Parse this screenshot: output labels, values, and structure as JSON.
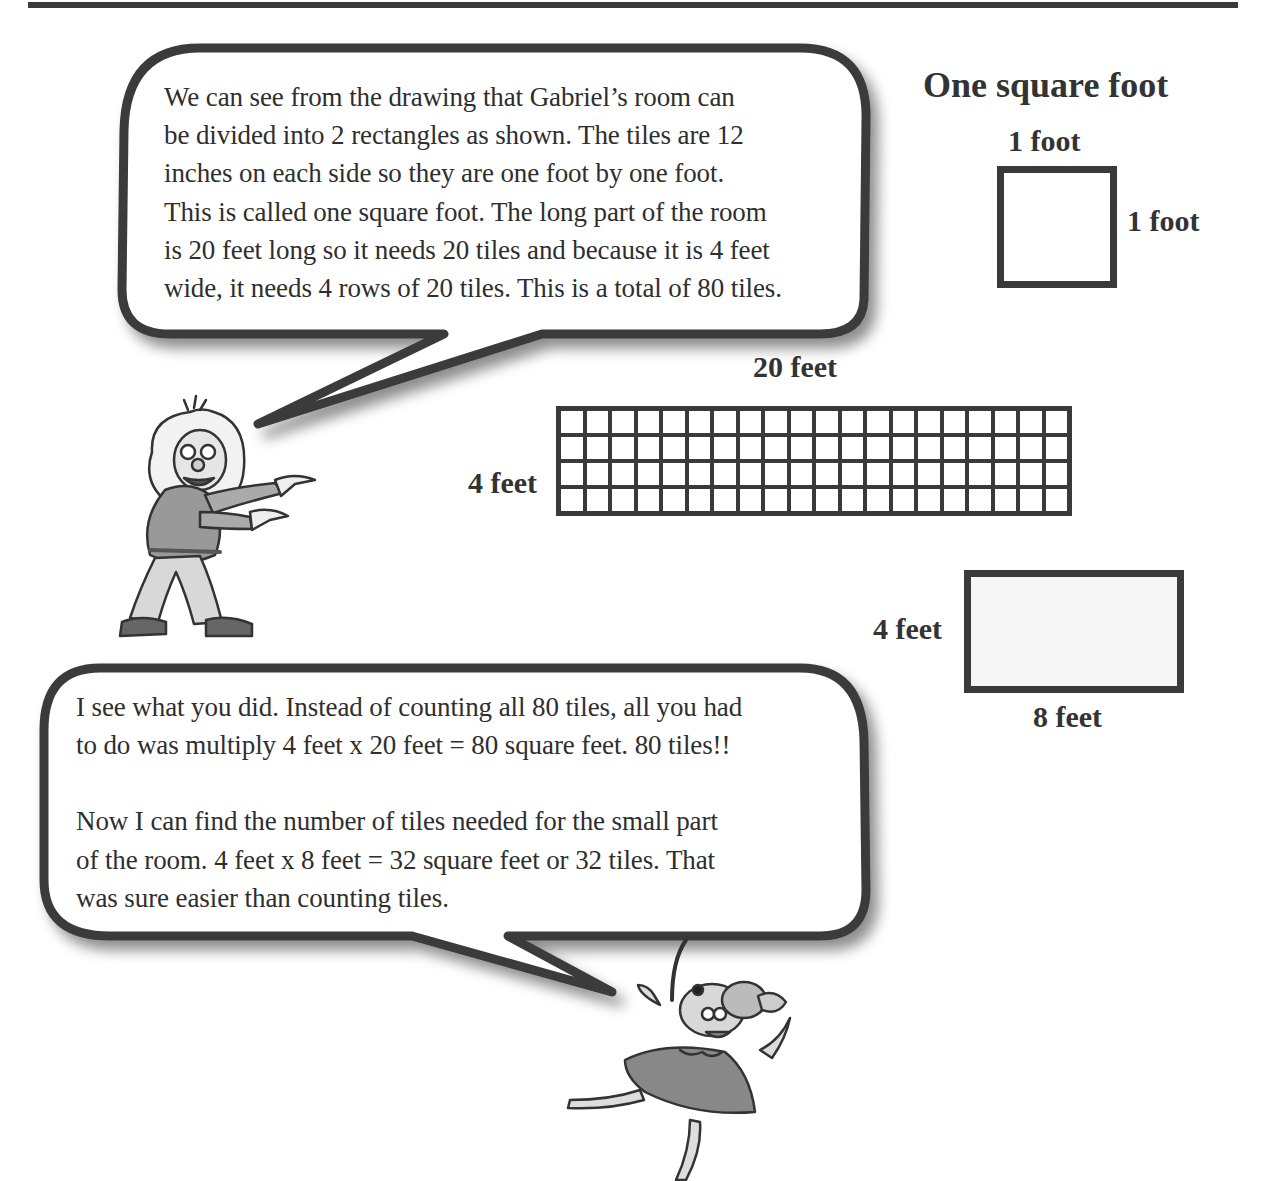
{
  "page": {
    "top_rule": true
  },
  "bubble_top": {
    "speaker": "boy",
    "lines": [
      "We can see from the drawing that Gabriel’s room can",
      "be divided into 2 rectangles as shown. The tiles are 12",
      "inches on each side so they are one foot by one foot.",
      "This is called one square foot. The long part of the room",
      "is 20 feet long so it needs 20 tiles and because it is 4 feet",
      "wide, it needs 4 rows of 20 tiles. This is a total of 80 tiles."
    ]
  },
  "square_foot": {
    "title": "One square foot",
    "top_label": "1 foot",
    "side_label": "1 foot"
  },
  "large_rectangle": {
    "top_label": "20 feet",
    "side_label": "4 feet",
    "columns": 20,
    "rows": 4
  },
  "small_rectangle": {
    "side_label": "4 feet",
    "bottom_label": "8 feet"
  },
  "bubble_bottom": {
    "speaker": "mouse",
    "paragraph1": [
      "I see what you did. Instead of counting all 80 tiles, all you had",
      "to do was multiply 4 feet x 20 feet = 80 square feet. 80 tiles!!"
    ],
    "paragraph2": [
      "Now I can find the number of tiles needed for the small part",
      "of the room. 4 feet x 8 feet = 32 square feet or 32 tiles. That",
      "was sure easier than counting tiles."
    ]
  },
  "illustrations": {
    "boy": "cartoon-boy-pointing",
    "mouse": "cartoon-mouse-jumping"
  }
}
